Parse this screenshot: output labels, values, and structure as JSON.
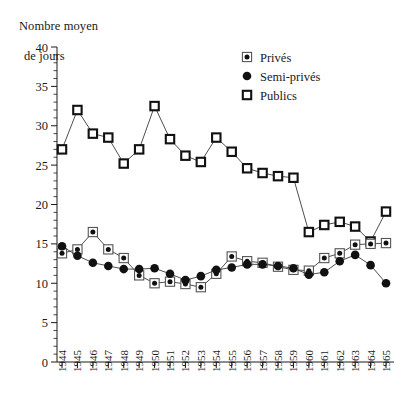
{
  "axis_title": {
    "line1": "Nombre moyen",
    "line2": "de jours"
  },
  "legend": {
    "items": [
      {
        "label": "Privés",
        "marker": "square-with-dot-icon"
      },
      {
        "label": "Semi-privés",
        "marker": "filled-circle-icon"
      },
      {
        "label": "Publics",
        "marker": "open-square-icon"
      }
    ]
  },
  "chart_data": {
    "type": "line",
    "title": "",
    "subtitle": "",
    "xlabel": "",
    "ylabel": "Nombre moyen de jours",
    "xlim": [
      1944,
      1965
    ],
    "ylim": [
      0,
      40
    ],
    "ytick_labels": [
      "0",
      "5",
      "10",
      "15",
      "20",
      "25",
      "30",
      "35",
      "40"
    ],
    "yticks": [
      0,
      5,
      10,
      15,
      20,
      25,
      30,
      35,
      40
    ],
    "yminor_step": 1,
    "grid": false,
    "legend_position": "top-right",
    "categories": [
      "1944",
      "1945",
      "1946",
      "1947",
      "1948",
      "1949",
      "1950",
      "1951",
      "1952",
      "1953",
      "1954",
      "1955",
      "1956",
      "1957",
      "1958",
      "1959",
      "1960",
      "1961",
      "1962",
      "1963",
      "1964",
      "1965"
    ],
    "x": [
      1944,
      1945,
      1946,
      1947,
      1948,
      1949,
      1950,
      1951,
      1952,
      1953,
      1954,
      1955,
      1956,
      1957,
      1958,
      1959,
      1960,
      1961,
      1962,
      1963,
      1964,
      1965
    ],
    "series": [
      {
        "name": "Privés",
        "marker": "square-with-dot-icon",
        "values": [
          13.8,
          14.3,
          16.5,
          14.3,
          13.2,
          11.0,
          10.0,
          10.2,
          9.9,
          9.5,
          11.2,
          13.4,
          12.8,
          12.6,
          12.1,
          11.7,
          11.6,
          13.2,
          13.8,
          14.9,
          15.0,
          15.1
        ]
      },
      {
        "name": "Semi-privés",
        "marker": "filled-circle-icon",
        "values": [
          14.7,
          13.5,
          12.6,
          12.2,
          11.8,
          11.8,
          11.9,
          11.2,
          10.4,
          10.9,
          11.7,
          12.0,
          12.4,
          12.4,
          12.2,
          11.9,
          11.1,
          11.4,
          12.8,
          13.6,
          12.3,
          10.0
        ]
      },
      {
        "name": "Publics",
        "marker": "open-square-icon",
        "values": [
          27.0,
          32.0,
          29.0,
          28.5,
          25.2,
          27.0,
          32.5,
          28.3,
          26.2,
          25.4,
          28.5,
          26.7,
          24.6,
          24.0,
          23.6,
          23.4,
          16.5,
          17.4,
          17.8,
          17.2,
          15.3,
          19.1
        ]
      }
    ]
  }
}
